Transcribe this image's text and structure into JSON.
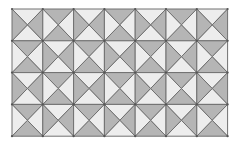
{
  "diagram": {
    "type": "triangle-quartered square tiling",
    "rows": 4,
    "cols": 7,
    "origin": [
      12,
      9
    ],
    "cell_width": 30.8,
    "cell_height": 31.8,
    "colors": {
      "dark": "#b5b5b5",
      "light": "#ededed",
      "line": "#707070",
      "vertex": "#555555",
      "background": "#ffffff"
    },
    "pattern_rule": "checkerboard: (row+col) even -> left/right triangles dark; odd -> top/bottom triangles dark",
    "cells": [
      [
        "V",
        "H",
        "V",
        "H",
        "V",
        "H",
        "V"
      ],
      [
        "H",
        "V",
        "H",
        "V",
        "H",
        "V",
        "H"
      ],
      [
        "V",
        "H",
        "V",
        "H",
        "V",
        "H",
        "V"
      ],
      [
        "H",
        "V",
        "H",
        "V",
        "H",
        "V",
        "H"
      ]
    ]
  }
}
